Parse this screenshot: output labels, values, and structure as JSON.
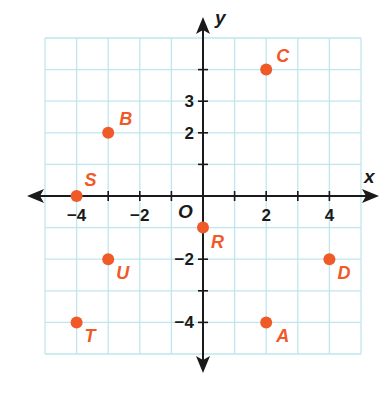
{
  "chart_data": {
    "type": "scatter",
    "title": "",
    "xlabel": "x",
    "ylabel": "y",
    "origin_label": "O",
    "xlim": [
      -5,
      5
    ],
    "ylim": [
      -5,
      5
    ],
    "grid": true,
    "x_tick_labels": [
      {
        "value": -4,
        "label": "−4"
      },
      {
        "value": -2,
        "label": "−2"
      },
      {
        "value": 2,
        "label": "2"
      },
      {
        "value": 4,
        "label": "4"
      }
    ],
    "y_tick_labels": [
      {
        "value": 3,
        "label": "3"
      },
      {
        "value": 2,
        "label": "2"
      },
      {
        "value": -2,
        "label": "−2"
      },
      {
        "value": -4,
        "label": "−4"
      }
    ],
    "points": [
      {
        "label": "A",
        "x": 2,
        "y": -4
      },
      {
        "label": "B",
        "x": -3,
        "y": 2
      },
      {
        "label": "C",
        "x": 2,
        "y": 4
      },
      {
        "label": "D",
        "x": 4,
        "y": -2
      },
      {
        "label": "R",
        "x": 0,
        "y": -1
      },
      {
        "label": "S",
        "x": -4,
        "y": 0
      },
      {
        "label": "T",
        "x": -4,
        "y": -4
      },
      {
        "label": "U",
        "x": -3,
        "y": -2
      }
    ],
    "colors": {
      "grid": "#bfe6ee",
      "axis": "#1a1a1a",
      "point": "#f05a28"
    }
  }
}
